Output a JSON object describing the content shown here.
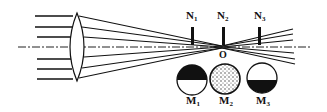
{
  "diagram": {
    "type": "optics-knife-edge-test",
    "colors": {
      "ink": "#111111",
      "background": "#ffffff",
      "stipple": "#555555"
    },
    "focus_label": "O",
    "knife_edges": [
      {
        "id": "N1",
        "base": "N",
        "sub": "1"
      },
      {
        "id": "N2",
        "base": "N",
        "sub": "2"
      },
      {
        "id": "N3",
        "base": "N",
        "sub": "3"
      }
    ],
    "screens": [
      {
        "id": "M1",
        "base": "M",
        "sub": "1",
        "pattern": "top-half-dark"
      },
      {
        "id": "M2",
        "base": "M",
        "sub": "2",
        "pattern": "uniform-stipple"
      },
      {
        "id": "M3",
        "base": "M",
        "sub": "3",
        "pattern": "bottom-half-dark"
      }
    ]
  }
}
